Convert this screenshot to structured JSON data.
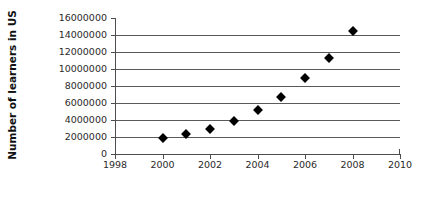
{
  "chart_data": {
    "type": "scatter",
    "title": "",
    "xlabel": "",
    "ylabel": "Number of learners in US",
    "x": [
      2000,
      2001,
      2002,
      2003,
      2004,
      2005,
      2006,
      2007,
      2008
    ],
    "values": [
      1900000,
      2400000,
      3000000,
      3900000,
      5200000,
      6700000,
      8900000,
      11300000,
      14500000
    ],
    "series": [
      {
        "name": "Number of learners in US",
        "values": [
          1900000,
          2400000,
          3000000,
          3900000,
          5200000,
          6700000,
          8900000,
          11300000,
          14500000
        ]
      }
    ],
    "xlim": [
      1998,
      2010
    ],
    "ylim": [
      0,
      16000000
    ],
    "x_ticks": [
      "1998",
      "2000",
      "2002",
      "2004",
      "2006",
      "2008",
      "2010"
    ],
    "x_tick_values": [
      1998,
      2000,
      2002,
      2004,
      2006,
      2008,
      2010
    ],
    "y_ticks": [
      "0",
      "2000000",
      "4000000",
      "6000000",
      "8000000",
      "10000000",
      "12000000",
      "14000000",
      "16000000"
    ],
    "y_tick_values": [
      0,
      2000000,
      4000000,
      6000000,
      8000000,
      10000000,
      12000000,
      14000000,
      16000000
    ],
    "grid": "horizontal",
    "legend": "none",
    "marker": "diamond",
    "marker_color": "#000000",
    "gridline_color": "#5a5a5a",
    "axis_color": "#4d4d4d",
    "background_color": "#ffffff"
  }
}
